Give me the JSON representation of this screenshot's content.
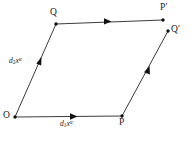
{
  "figure": {
    "name": "parallelogram-displacement-diagram",
    "background_color": "#ffffff",
    "stroke_color": "#3c3c3c",
    "marker_color": "#111111",
    "text_color": "#1a1a1a",
    "width": 190,
    "height": 146
  },
  "vertices": [
    {
      "id": "O",
      "label": "O",
      "x": 15,
      "y": 117,
      "label_x": 3,
      "label_y": 111
    },
    {
      "id": "P",
      "label": "P",
      "x": 122,
      "y": 116,
      "label_x": 119,
      "label_y": 118
    },
    {
      "id": "Q",
      "label": "Q",
      "x": 56,
      "y": 24,
      "label_x": 50,
      "label_y": 8
    },
    {
      "id": "Pp",
      "label": "P",
      "prime": "′",
      "x": 163,
      "y": 20,
      "label_x": 160,
      "label_y": 3
    },
    {
      "id": "Qp",
      "label": "Q",
      "prime": "′",
      "x": 168,
      "y": 31,
      "label_x": 171,
      "label_y": 25
    }
  ],
  "edges": [
    {
      "id": "O-P",
      "from": "O",
      "to": "P",
      "has_arrow": true,
      "arrow_t": 0.55
    },
    {
      "id": "O-Q",
      "from": "O",
      "to": "Q",
      "has_arrow": true,
      "arrow_t": 0.62
    },
    {
      "id": "Q-Pp",
      "from": "Q",
      "to": "Pp",
      "has_arrow": true,
      "arrow_t": 0.52
    },
    {
      "id": "P-Qp",
      "from": "P",
      "to": "Qp",
      "has_arrow": true,
      "arrow_t": 0.55
    }
  ],
  "edge_labels": [
    {
      "id": "d1",
      "edge": "O-P",
      "base": "d",
      "sub": "1",
      "var": "x",
      "sup": "α",
      "text": "d₁xᵅ",
      "x": 60,
      "y": 120
    },
    {
      "id": "d2",
      "edge": "O-Q",
      "base": "d",
      "sub": "2",
      "var": "x",
      "sup": "α",
      "text": "d₂xᵅ",
      "x": 9,
      "y": 57
    }
  ],
  "primes": {
    "symbol": "′"
  }
}
